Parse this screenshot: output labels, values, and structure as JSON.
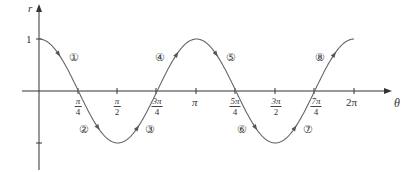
{
  "chart_data": {
    "type": "line",
    "title": "",
    "xlabel": "θ",
    "ylabel": "r",
    "function": "r = cos(2θ)",
    "xlim": [
      0,
      6.2832
    ],
    "ylim": [
      -1,
      1
    ],
    "grid": false,
    "x_ticks": [
      {
        "num": "π",
        "den": "4",
        "value": 0.7854
      },
      {
        "num": "π",
        "den": "2",
        "value": 1.5708
      },
      {
        "num": "3π",
        "den": "4",
        "value": 2.3562
      },
      {
        "label": "π",
        "value": 3.1416
      },
      {
        "num": "5π",
        "den": "4",
        "value": 3.927
      },
      {
        "num": "3π",
        "den": "2",
        "value": 4.7124
      },
      {
        "num": "7π",
        "den": "4",
        "value": 5.4978
      },
      {
        "label": "2π",
        "value": 6.2832
      }
    ],
    "y_ticks": [
      {
        "label": "1",
        "value": 1
      },
      {
        "label": "",
        "value": -1
      }
    ],
    "x": [
      0,
      0.7854,
      1.5708,
      2.3562,
      3.1416,
      3.927,
      4.7124,
      5.4978,
      6.2832
    ],
    "values": [
      1,
      0,
      -1,
      0,
      1,
      0,
      -1,
      0,
      1
    ],
    "segment_labels": [
      "①",
      "②",
      "③",
      "④",
      "⑤",
      "⑥",
      "⑦",
      "⑧"
    ]
  },
  "axis": {
    "r_label": "r",
    "theta_label": "θ",
    "one_label": "1",
    "pi_label": "π",
    "two_pi_label": "2π"
  },
  "colors": {
    "curve": "#666666",
    "axis": "#333333"
  }
}
